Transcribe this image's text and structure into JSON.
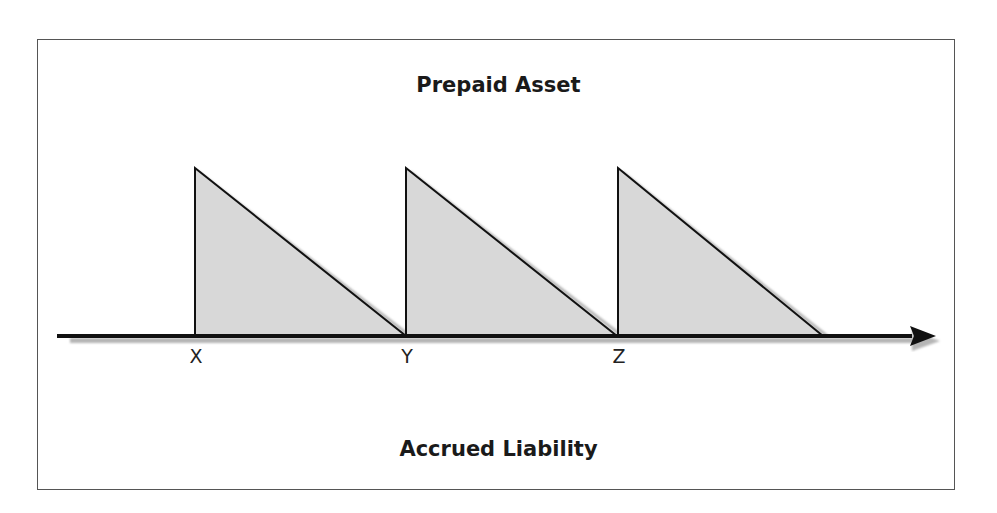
{
  "diagram": {
    "top_label": "Prepaid Asset",
    "bottom_label": "Accrued Liability",
    "axis": {
      "direction": "right",
      "ticks": [
        {
          "label": "X",
          "x": 195
        },
        {
          "label": "Y",
          "x": 406
        },
        {
          "label": "Z",
          "x": 618
        }
      ]
    },
    "triangles": [
      {
        "start": "X",
        "end": "Y",
        "fill": "#d8d8d8"
      },
      {
        "start": "Y",
        "end": "Z",
        "fill": "#d8d8d8"
      },
      {
        "start": "Z",
        "end": "beyond Z",
        "fill": "#d8d8d8"
      }
    ],
    "colors": {
      "fill": "#d8d8d8",
      "stroke": "#111111",
      "shadow": "#b5b5b5"
    }
  }
}
